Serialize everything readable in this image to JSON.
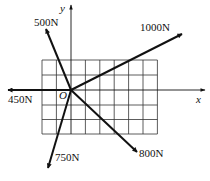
{
  "diagram": {
    "type": "force-vectors-on-grid",
    "origin": {
      "label": "O",
      "x": 71,
      "y": 90
    },
    "axes": {
      "x": {
        "label": "x"
      },
      "y": {
        "label": "y"
      }
    },
    "grid": {
      "columns": 8,
      "rows": 5,
      "left": 42,
      "top": 60,
      "cell": 14.4
    },
    "forces": [
      {
        "label": "1000N",
        "magnitude_N": 1000,
        "tip": {
          "x": 182,
          "y": 34
        }
      },
      {
        "label": "500N",
        "magnitude_N": 500,
        "tip": {
          "x": 46,
          "y": 29
        }
      },
      {
        "label": "450N",
        "magnitude_N": 450,
        "tip": {
          "x": 8,
          "y": 90
        }
      },
      {
        "label": "750N",
        "magnitude_N": 750,
        "tip": {
          "x": 48,
          "y": 168
        }
      },
      {
        "label": "800N",
        "magnitude_N": 800,
        "tip": {
          "x": 137,
          "y": 152
        }
      }
    ],
    "colors": {
      "lines": "#111111",
      "grid": "#333333",
      "background": "#ffffff"
    }
  }
}
